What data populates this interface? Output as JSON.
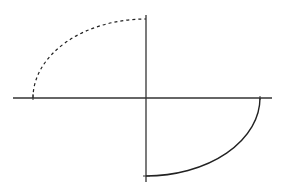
{
  "diagram": {
    "origin": {
      "x": 146,
      "y": 98
    },
    "axes": {
      "horizontal": {
        "x1": 13,
        "x2": 272,
        "y": 98
      },
      "vertical": {
        "x": 146,
        "y1": 15,
        "y2": 182
      }
    },
    "arcs": [
      {
        "name": "upper-left-dashed-arc",
        "style": "dashed",
        "start": [
          33,
          98
        ],
        "end": [
          146,
          19
        ],
        "rx": 113,
        "ry": 79
      },
      {
        "name": "lower-right-solid-arc",
        "style": "solid",
        "start": [
          260,
          98
        ],
        "end": [
          146,
          176
        ],
        "rx": 114,
        "ry": 78
      }
    ],
    "colors": {
      "axis": "#333333",
      "curve": "#222222",
      "background": "#ffffff"
    }
  }
}
